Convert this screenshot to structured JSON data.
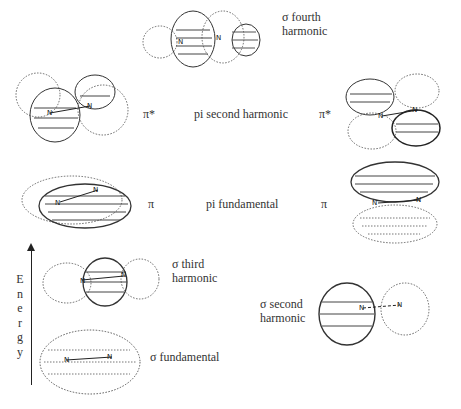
{
  "diagram": {
    "axis": {
      "label": "Energy",
      "letters": [
        "E",
        "n",
        "e",
        "r",
        "g",
        "y"
      ]
    },
    "orbitals": [
      {
        "id": "sigma-fourth",
        "symbol": "",
        "label_line1": "σ fourth",
        "label_line2": "harmonic",
        "atoms": [
          "N",
          "N"
        ]
      },
      {
        "id": "pi-star-left",
        "symbol": "π*",
        "atoms": [
          "N",
          "N"
        ]
      },
      {
        "id": "pi-second",
        "label": "pi second harmonic"
      },
      {
        "id": "pi-star-right",
        "symbol": "π*",
        "atoms": [
          "N",
          "N"
        ]
      },
      {
        "id": "pi-left",
        "symbol": "π",
        "atoms": [
          "N",
          "N"
        ]
      },
      {
        "id": "pi-fundamental",
        "label": "pi fundamental"
      },
      {
        "id": "pi-right",
        "symbol": "π",
        "atoms": [
          "N",
          "N"
        ]
      },
      {
        "id": "sigma-third",
        "label_line1": "σ third",
        "label_line2": "harmonic",
        "atoms": [
          "N",
          "N"
        ]
      },
      {
        "id": "sigma-second",
        "label_line1": "σ second",
        "label_line2": "harmonic",
        "atoms": [
          "N",
          "N"
        ]
      },
      {
        "id": "sigma-fundamental",
        "label": "σ fundamental",
        "atoms": [
          "N",
          "N"
        ]
      }
    ]
  }
}
